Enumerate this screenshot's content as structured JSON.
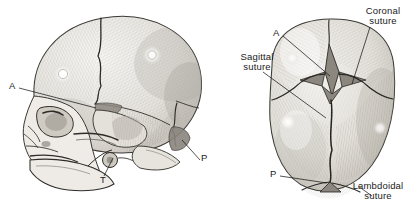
{
  "figure": {
    "background_color": "#ffffff",
    "ink_color": "#1a1a1a",
    "bone_fill": "#e9e7e3",
    "fontanelle_fill": "#9a958e",
    "shadow_fill": "#b9b5ae"
  },
  "views": {
    "lateral": {
      "name": "Lateral view of neonatal skull",
      "position": "left"
    },
    "superior": {
      "name": "Superior view of neonatal skull",
      "position": "right"
    }
  },
  "labels": {
    "lateral_anterior_fontanelle": "A",
    "lateral_temporal_fontanelle": "T",
    "lateral_posterior_fontanelle": "P",
    "superior_anterior_fontanelle": "A",
    "superior_posterior_fontanelle": "P",
    "coronal_suture": "Coronal\nsuture",
    "sagittal_suture": "Sagittal\nsuture",
    "lambdoidal_suture": "Lambdoidal\nsuture"
  }
}
